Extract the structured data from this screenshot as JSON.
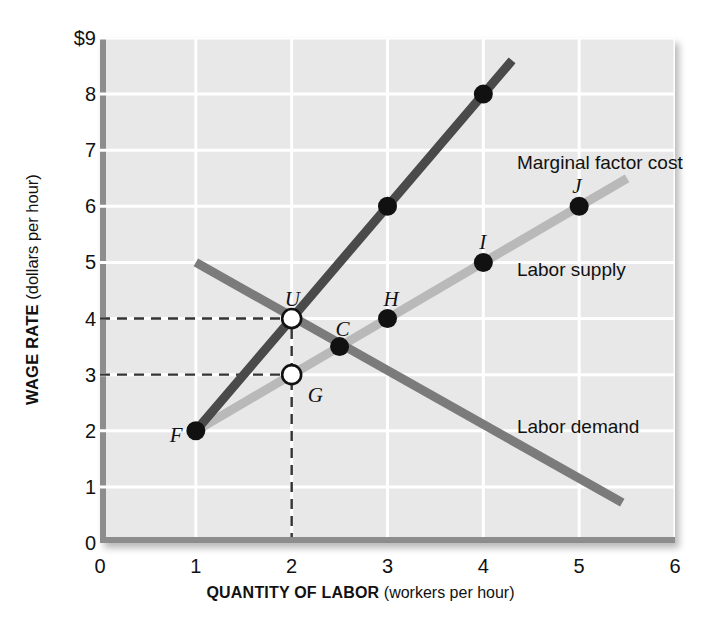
{
  "chart_data": {
    "type": "line",
    "title": "",
    "xlabel_bold": "QUANTITY OF LABOR",
    "xlabel_rest": " (workers per hour)",
    "ylabel_bold": "WAGE RATE",
    "ylabel_rest": " (dollars per hour)",
    "xlim": [
      0,
      6
    ],
    "ylim": [
      0,
      9
    ],
    "grid": true,
    "xticks": [
      "0",
      "1",
      "2",
      "3",
      "4",
      "5",
      "6"
    ],
    "yticks": [
      "0",
      "1",
      "2",
      "3",
      "4",
      "5",
      "6",
      "7",
      "8",
      "$9"
    ],
    "legend_position": "inline-annotations",
    "series": [
      {
        "name": "Marginal factor cost",
        "label": "Marginal factor cost",
        "color": "#4a4a4a",
        "x": [
          1,
          2,
          3,
          4,
          4.3
        ],
        "y": [
          2,
          4,
          6,
          8,
          8.6
        ],
        "markers": [
          {
            "x": 1,
            "y": 2,
            "style": "filled",
            "label": "F"
          },
          {
            "x": 3,
            "y": 6,
            "style": "filled",
            "label": ""
          },
          {
            "x": 4,
            "y": 8,
            "style": "filled",
            "label": ""
          }
        ],
        "label_x": 4.35,
        "label_y": 6.95
      },
      {
        "name": "Labor supply",
        "label": "Labor supply",
        "color": "#b9b9b9",
        "x": [
          1,
          2,
          3,
          4,
          5,
          5.5
        ],
        "y": [
          2,
          3,
          4,
          5,
          6,
          6.5
        ],
        "markers": [
          {
            "x": 1,
            "y": 2,
            "style": "filled",
            "label": "F"
          },
          {
            "x": 2,
            "y": 3,
            "style": "open",
            "label": "G"
          },
          {
            "x": 3,
            "y": 4,
            "style": "filled",
            "label": "H"
          },
          {
            "x": 4,
            "y": 5,
            "style": "filled",
            "label": "I"
          },
          {
            "x": 5,
            "y": 6,
            "style": "filled",
            "label": "J"
          }
        ],
        "label_x": 4.35,
        "label_y": 5.05
      },
      {
        "name": "Labor demand",
        "label": "Labor demand",
        "color": "#7b7b7b",
        "x": [
          1,
          5.45
        ],
        "y": [
          5,
          0.72
        ],
        "markers": [
          {
            "x": 2,
            "y": 4,
            "style": "open",
            "label": "U"
          },
          {
            "x": 2.5,
            "y": 3.5,
            "style": "filled",
            "label": "C"
          }
        ],
        "label_x": 4.35,
        "label_y": 2.25
      }
    ],
    "annotations": [
      {
        "label": "F",
        "x": 1,
        "y": 2,
        "note": "point on labor supply and MFC start"
      },
      {
        "label": "G",
        "x": 2,
        "y": 3,
        "note": "supply at equilibrium quantity"
      },
      {
        "label": "U",
        "x": 2,
        "y": 4,
        "note": "MFC equals labor demand"
      },
      {
        "label": "C",
        "x": 2.5,
        "y": 3.5,
        "note": "point on labor demand"
      },
      {
        "label": "H",
        "x": 3,
        "y": 4,
        "note": "point on labor supply"
      },
      {
        "label": "I",
        "x": 4,
        "y": 5,
        "note": "point on labor supply"
      },
      {
        "label": "J",
        "x": 5,
        "y": 6,
        "note": "point on labor supply"
      }
    ],
    "guide_lines": [
      {
        "type": "horizontal",
        "y": 4,
        "from_x": 0,
        "to_x": 2,
        "style": "dashed"
      },
      {
        "type": "horizontal",
        "y": 3,
        "from_x": 0,
        "to_x": 2,
        "style": "dashed"
      },
      {
        "type": "vertical",
        "x": 2,
        "from_y": 0,
        "to_y": 4,
        "style": "dashed"
      }
    ],
    "colors": {
      "panel": "#e8e8e8",
      "gridline": "#ffffff",
      "axis": "#8d8d8d",
      "marginal_factor_cost": "#4a4a4a",
      "labor_supply": "#b9b9b9",
      "labor_demand": "#7b7b7b",
      "dashed_guide": "#333333",
      "text": "#111111"
    }
  }
}
